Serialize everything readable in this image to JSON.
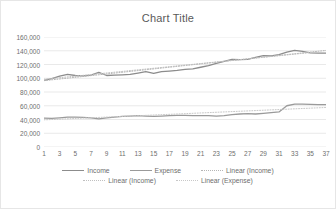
{
  "chart": {
    "title": "Chart Title",
    "frame_border_color": "#e6e6e6",
    "background": "#ffffff",
    "gridline_color": "#e0e0e0",
    "axis_text_color": "#6e6e6e"
  },
  "legend": {
    "position": "bottom",
    "rows": [
      [
        {
          "label": "Income",
          "color": "#8c8c8c",
          "style": "solid"
        },
        {
          "label": "Expense",
          "color": "#9a9a9a",
          "style": "solid"
        },
        {
          "label": "Linear (Income)",
          "color": "#b5b5b5",
          "style": "dotted"
        }
      ],
      [
        {
          "label": "Linear (Income)",
          "color": "#c0c0c0",
          "style": "dotted"
        },
        {
          "label": "Linear (Expense)",
          "color": "#c8c8c8",
          "style": "dotted"
        }
      ]
    ]
  },
  "chart_data": {
    "type": "line",
    "title": "Chart Title",
    "xlabel": "",
    "ylabel": "",
    "ylim": [
      0,
      160000
    ],
    "ytick_step": 20000,
    "ytick_labels": [
      "160,000",
      "140,000",
      "120,000",
      "100,000",
      "80,000",
      "60,000",
      "40,000",
      "20,000",
      "0"
    ],
    "ytick_values": [
      160000,
      140000,
      120000,
      100000,
      80000,
      60000,
      40000,
      20000,
      0
    ],
    "xlim": [
      1,
      37
    ],
    "xtick_labels": [
      "1",
      "3",
      "5",
      "7",
      "9",
      "11",
      "13",
      "15",
      "17",
      "19",
      "21",
      "23",
      "25",
      "27",
      "29",
      "31",
      "33",
      "35",
      "37"
    ],
    "xtick_values": [
      1,
      3,
      5,
      7,
      9,
      11,
      13,
      15,
      17,
      19,
      21,
      23,
      25,
      27,
      29,
      31,
      33,
      35,
      37
    ],
    "grid": true,
    "grid_axis": "y",
    "legend_position": "bottom",
    "x": [
      1,
      2,
      3,
      4,
      5,
      6,
      7,
      8,
      9,
      10,
      11,
      12,
      13,
      14,
      15,
      16,
      17,
      18,
      19,
      20,
      21,
      22,
      23,
      24,
      25,
      26,
      27,
      28,
      29,
      30,
      31,
      32,
      33,
      34,
      35,
      36,
      37
    ],
    "series": [
      {
        "name": "Income",
        "color": "#8c8c8c",
        "style": "solid",
        "values": [
          97000,
          99500,
          103000,
          105500,
          104000,
          103500,
          104500,
          108500,
          104000,
          104500,
          105000,
          105500,
          107500,
          109500,
          107000,
          109500,
          110500,
          111500,
          113000,
          113500,
          116000,
          118500,
          121500,
          124500,
          127500,
          127000,
          127500,
          130500,
          133000,
          132500,
          134500,
          138000,
          140500,
          139000,
          137000,
          136500,
          136500
        ]
      },
      {
        "name": "Expense",
        "color": "#9a9a9a",
        "style": "solid",
        "values": [
          42000,
          41500,
          42500,
          43500,
          43500,
          43000,
          42500,
          41000,
          42500,
          43500,
          44500,
          45000,
          45500,
          45000,
          44500,
          45000,
          45500,
          46000,
          46000,
          45500,
          45500,
          45500,
          45000,
          45500,
          47000,
          48000,
          48500,
          48000,
          49000,
          50000,
          51000,
          60000,
          62500,
          62500,
          62000,
          61500,
          61500
        ]
      },
      {
        "name": "Linear (Income)",
        "color": "#b5b5b5",
        "style": "dotted",
        "trend": true,
        "endpoints": [
          [
            1,
            96500
          ],
          [
            37,
            140500
          ]
        ]
      },
      {
        "name": "Linear (Income)",
        "color": "#c0c0c0",
        "style": "dotted",
        "trend": true,
        "endpoints": [
          [
            1,
            98500
          ],
          [
            36,
            138500
          ]
        ]
      },
      {
        "name": "Linear (Expense)",
        "color": "#c8c8c8",
        "style": "dotted",
        "trend": true,
        "endpoints": [
          [
            1,
            39500
          ],
          [
            37,
            57500
          ]
        ]
      }
    ]
  }
}
